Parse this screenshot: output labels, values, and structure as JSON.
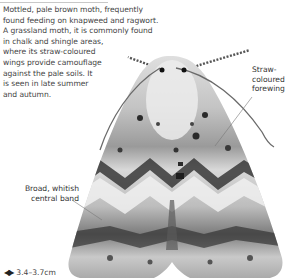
{
  "description": {
    "lines": [
      "Mottled, pale brown moth, frequently",
      "found feeding on knapweed and ragwort.",
      "A grassland moth, it is commonly found",
      "in chalk and shingle areas,",
      "where its straw-coloured",
      "wings provide camouflage",
      "against the pale soils. It",
      "is seen in late summer",
      "and autumn."
    ]
  },
  "annotations": {
    "forewing": {
      "lines": [
        "Straw-",
        "coloured",
        "forewing"
      ]
    },
    "band": {
      "lines": [
        "Broad, whitish",
        "central band"
      ]
    }
  },
  "size": {
    "icon": "wingspan-arrows-icon",
    "value": "3.4–3.7cm"
  },
  "image": {
    "subject": "moth-illustration",
    "colors": {
      "wing_base": "#b9b9b9",
      "wing_light": "#e6e6e6",
      "wing_dark": "#2e2e2e"
    }
  }
}
